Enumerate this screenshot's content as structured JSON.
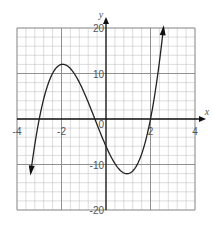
{
  "chart_data": {
    "type": "line",
    "title": "",
    "xlabel": "x",
    "ylabel": "y",
    "xlim": [
      -4,
      4
    ],
    "ylim": [
      -20,
      20
    ],
    "grid": true,
    "x_tick_labels": [
      "-4",
      "-2",
      "2",
      "4"
    ],
    "y_tick_labels": [
      "20",
      "10",
      "-10",
      "-20"
    ],
    "origin_label": "0",
    "series": [
      {
        "name": "cubic curve",
        "function": "y = (x + 3)(2x + 1)(x - 2)",
        "x": [
          -3.35,
          -3,
          -2.5,
          -2,
          -1.5,
          -1,
          -0.5,
          0,
          0.5,
          1,
          1.5,
          2,
          2.5
        ],
        "values": [
          -21.3,
          0,
          9,
          12,
          7,
          2.4,
          0,
          -6,
          -10,
          -12,
          -9,
          0,
          16.5
        ],
        "key_points": {
          "roots": [
            -3,
            -0.5,
            2
          ],
          "local_max": [
            -2,
            12
          ],
          "local_min": [
            1,
            -12
          ],
          "y_intercept": -6
        },
        "arrows_at_ends": true
      }
    ]
  }
}
